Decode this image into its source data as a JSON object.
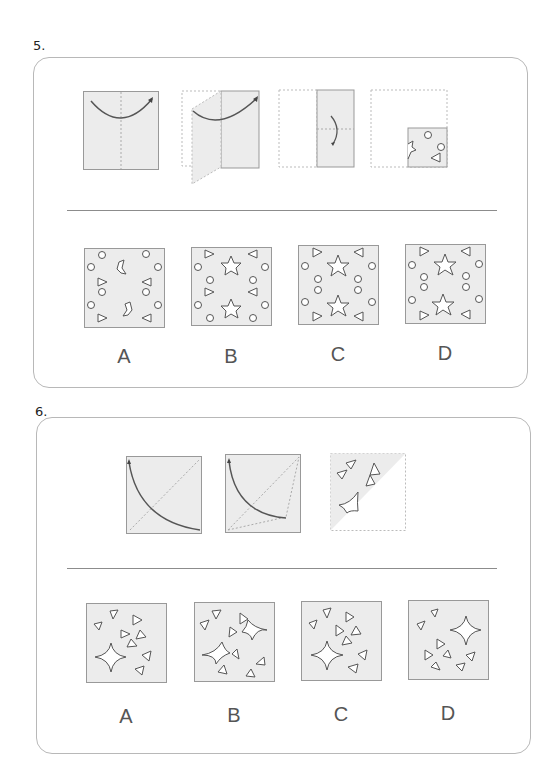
{
  "questions": [
    {
      "number": "5.",
      "prompt_steps": [
        {
          "id": "step1",
          "description": "square folded right-to-left along vertical center line (arrow)"
        },
        {
          "id": "step2",
          "description": "left half folding over onto right half"
        },
        {
          "id": "step3",
          "description": "half folded top-to-bottom along horizontal center line (arrow)"
        },
        {
          "id": "step4",
          "description": "quarter with holes punched: 2 circles, 1 triangle, 1 irregular notch"
        }
      ],
      "options": [
        {
          "label": "A",
          "description": "irregular notches, circles and triangles"
        },
        {
          "label": "B",
          "description": "two stars, circles and triangles"
        },
        {
          "label": "C",
          "description": "two stars, circles and triangles"
        },
        {
          "label": "D",
          "description": "two stars, circles and triangles"
        }
      ]
    },
    {
      "number": "6.",
      "prompt_steps": [
        {
          "id": "step1",
          "description": "square folded along diagonal from bottom-right to top-left (arrow)"
        },
        {
          "id": "step2",
          "description": "folding in progress along diagonal"
        },
        {
          "id": "step3",
          "description": "folded triangle with four triangles and a curved shape cut"
        }
      ],
      "options": [
        {
          "label": "A",
          "description": "four-pointed star with triangles"
        },
        {
          "label": "B",
          "description": "two curved shapes with triangles"
        },
        {
          "label": "C",
          "description": "four-pointed star with triangles"
        },
        {
          "label": "D",
          "description": "four-pointed star top-right with triangles"
        }
      ]
    }
  ],
  "colors": {
    "paper_fill": "#ececec",
    "outline": "#555555",
    "dotted": "#aaaaaa",
    "panel_border": "#b8b8b8"
  }
}
